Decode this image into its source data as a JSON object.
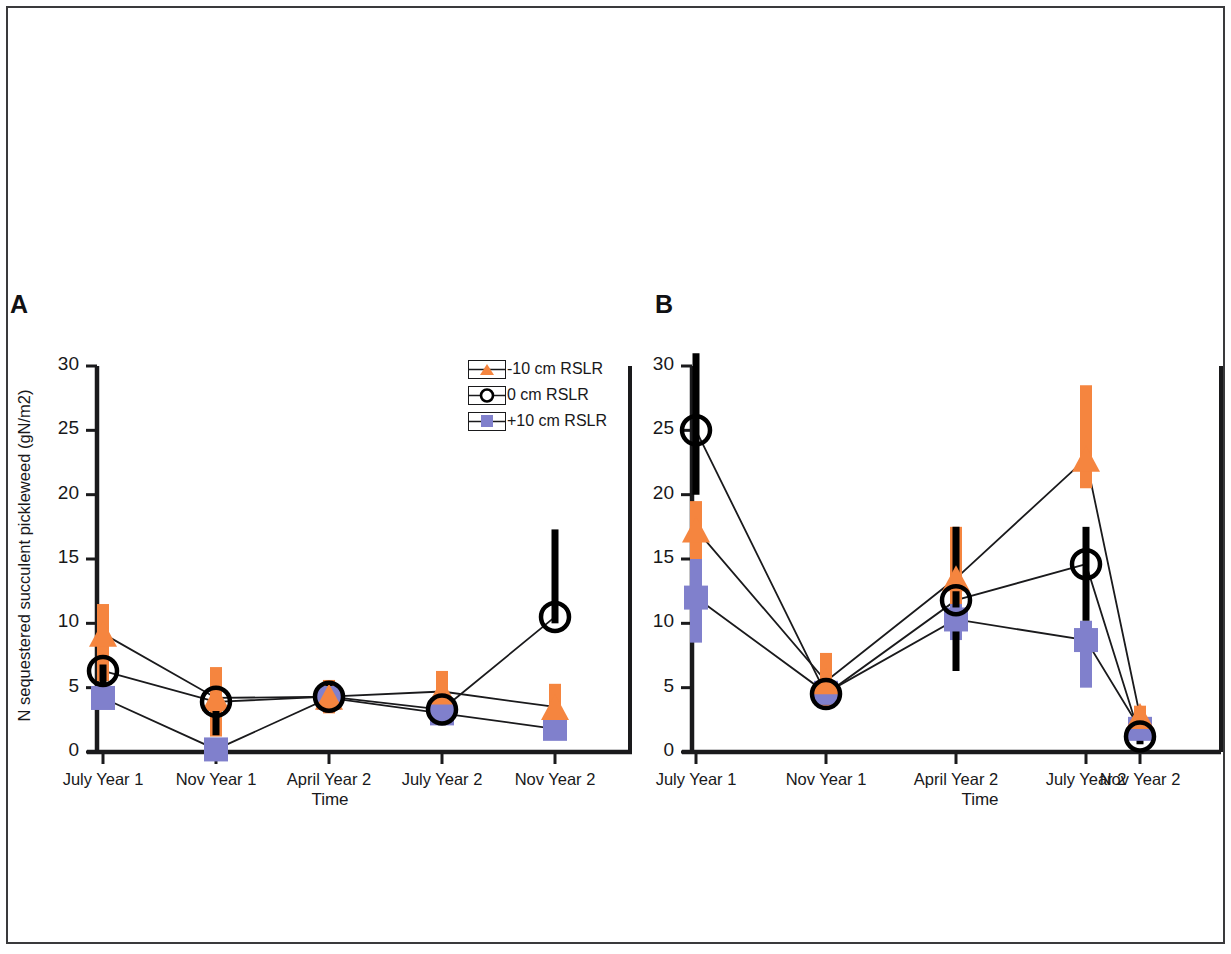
{
  "figure": {
    "background": "#ffffff",
    "axis_color": "#1a1a1c",
    "panels": [
      {
        "id": "A",
        "label": "A"
      },
      {
        "id": "B",
        "label": "B"
      }
    ]
  },
  "legend": {
    "position": "inside-top-right-panel-a",
    "entries": [
      {
        "label": "-10 cm RSLR",
        "color": "#F5853F",
        "marker": "triangle"
      },
      {
        "label": "0 cm RSLR",
        "color": "#000000",
        "marker": "open-circle"
      },
      {
        "label": "+10 cm RSLR",
        "color": "#8080CC",
        "marker": "square"
      }
    ]
  },
  "axes": {
    "ylabel": "N sequestered succulent pickleweed (gN/m2)",
    "xlabel": "Time",
    "yticks": [
      0,
      5,
      10,
      15,
      20,
      25,
      30
    ],
    "ylim": [
      0,
      30
    ],
    "categories": [
      "July Year 1",
      "Nov Year 1",
      "April Year 2",
      "July Year 2",
      "Nov Year 2"
    ]
  },
  "chart_data": [
    {
      "type": "line",
      "panel": "A",
      "title": "A",
      "xlabel": "Time",
      "ylabel": "N sequestered succulent pickleweed (gN/m2)",
      "ylim": [
        0,
        30
      ],
      "yticks": [
        0,
        5,
        10,
        15,
        20,
        25,
        30
      ],
      "grid": false,
      "legend_position": "upper right",
      "categories": [
        "July Year 1",
        "Nov Year 1",
        "April Year 2",
        "July Year 2",
        "Nov Year 2"
      ],
      "series": [
        {
          "name": "-10 cm RSLR",
          "color": "#F5853F",
          "marker": "triangle",
          "values": [
            9.2,
            4.2,
            4.3,
            4.7,
            3.5
          ],
          "err_low": [
            5.5,
            1.2,
            3.0,
            3.6,
            2.0
          ],
          "err_high": [
            11.5,
            6.6,
            5.6,
            6.3,
            5.3
          ]
        },
        {
          "name": "0 cm RSLR",
          "color": "#000000",
          "marker": "open-circle",
          "values": [
            6.3,
            3.9,
            4.3,
            3.3,
            10.5
          ],
          "err_low": [
            5.0,
            1.3,
            3.4,
            2.6,
            10.0
          ],
          "err_high": [
            6.8,
            4.6,
            5.4,
            3.8,
            17.3
          ]
        },
        {
          "name": "+10 cm RSLR",
          "color": "#8080CC",
          "marker": "square",
          "values": [
            4.2,
            0.2,
            4.2,
            3.0,
            1.8
          ],
          "err_low": [
            3.6,
            0.0,
            3.6,
            2.6,
            1.3
          ],
          "err_high": [
            4.8,
            0.7,
            4.9,
            3.5,
            2.3
          ]
        }
      ]
    },
    {
      "type": "line",
      "panel": "B",
      "title": "B",
      "xlabel": "Time",
      "ylabel": "N sequestered succulent pickleweed (gN/m2)",
      "ylim": [
        0,
        30
      ],
      "yticks": [
        0,
        5,
        10,
        15,
        20,
        25,
        30
      ],
      "grid": false,
      "legend_position": "none",
      "categories": [
        "July Year 1",
        "Nov Year 1",
        "April Year 2",
        "July Year 2",
        "Nov Year 2"
      ],
      "series": [
        {
          "name": "-10 cm RSLR",
          "color": "#F5853F",
          "marker": "triangle",
          "values": [
            17.3,
            5.5,
            13.5,
            22.8,
            2.8
          ],
          "err_low": [
            15.0,
            3.6,
            11.5,
            20.5,
            1.8
          ],
          "err_high": [
            19.5,
            7.7,
            17.5,
            28.5,
            3.6
          ]
        },
        {
          "name": "0 cm RSLR",
          "color": "#000000",
          "marker": "open-circle",
          "values": [
            25.0,
            4.5,
            11.8,
            14.6,
            1.2
          ],
          "err_low": [
            20.0,
            3.7,
            6.3,
            10.2,
            0.6
          ],
          "err_high": [
            31.0,
            5.4,
            17.5,
            17.5,
            2.0
          ]
        },
        {
          "name": "+10 cm RSLR",
          "color": "#8080CC",
          "marker": "square",
          "values": [
            12.0,
            4.6,
            10.3,
            8.7,
            1.8
          ],
          "err_low": [
            8.5,
            3.5,
            8.7,
            5.0,
            1.0
          ],
          "err_high": [
            15.0,
            5.3,
            11.5,
            10.2,
            2.6
          ]
        }
      ]
    }
  ]
}
